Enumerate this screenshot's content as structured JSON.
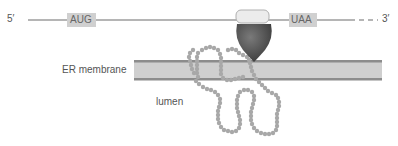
{
  "labels": {
    "five_prime": "5′",
    "three_prime": "3′",
    "start_codon": "AUG",
    "stop_codon": "UAA",
    "membrane": "ER membrane",
    "lumen": "lumen"
  },
  "colors": {
    "mrna_line": "#b5b5b5",
    "codon_box": "#d0d0d0",
    "membrane_fill": "#cfcfcf",
    "membrane_edge": "#8c8c8c",
    "ribosome_large": "#5a5a5a",
    "ribosome_small": "#ececec",
    "polypeptide_bead": "#a8a8a8",
    "text": "#555555"
  }
}
